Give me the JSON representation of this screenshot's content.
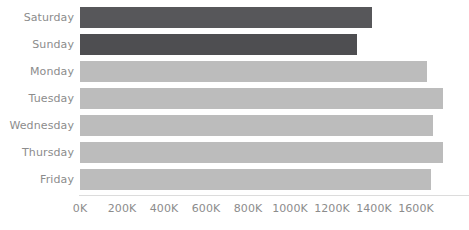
{
  "chart_data": {
    "type": "bar",
    "orientation": "horizontal",
    "title": "",
    "subtitle": "",
    "xlabel": "",
    "ylabel": "",
    "categories": [
      "Saturday",
      "Sunday",
      "Monday",
      "Tuesday",
      "Wednesday",
      "Thursday",
      "Friday"
    ],
    "values": [
      1390000,
      1320000,
      1650000,
      1730000,
      1680000,
      1730000,
      1670000
    ],
    "series": [
      {
        "name": "Value",
        "values": [
          1390000,
          1320000,
          1650000,
          1730000,
          1680000,
          1730000,
          1670000
        ]
      }
    ],
    "bar_colors": [
      "#57575a",
      "#4e4e51",
      "#bcbcbc",
      "#bcbcbc",
      "#bcbcbc",
      "#bcbcbc",
      "#bcbcbc"
    ],
    "xlim": [
      0,
      1700000
    ],
    "x_tick_values": [
      0,
      200000,
      400000,
      600000,
      800000,
      1000000,
      1200000,
      1400000,
      1600000
    ],
    "x_tick_labels": [
      "0K",
      "200K",
      "400K",
      "600K",
      "800K",
      "1000K",
      "1200K",
      "1400K",
      "1600K"
    ],
    "grid": false,
    "legend": null,
    "legend_position": "none",
    "annotations": []
  },
  "colors": {
    "weekend_bar": "#57575a",
    "weekday_bar": "#bcbcbc",
    "axis_line": "#dcdcdc",
    "tick_text": "#8c8c8c",
    "background": "#ffffff"
  }
}
